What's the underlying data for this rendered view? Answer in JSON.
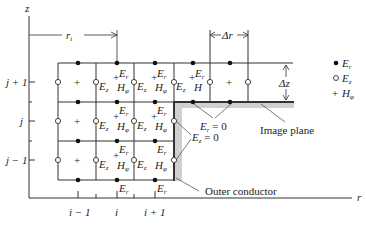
{
  "axes": {
    "z_label": "z",
    "r_label": "r",
    "z_ticks": [
      "j + 1",
      "j",
      "j − 1"
    ],
    "r_ticks": [
      "i − 1",
      "i",
      "i + 1"
    ]
  },
  "dimensions": {
    "ri_label": "r",
    "ri_sub": "i",
    "dr_label": "Δr",
    "dz_label": "Δz"
  },
  "field_labels": {
    "er": "E",
    "er_sub": "r",
    "ez": "E",
    "ez_sub": "z",
    "hphi": "H",
    "hphi_sub": "φ",
    "h_plain": "H"
  },
  "annotations": {
    "er_zero": "E",
    "er_zero_sub": "r",
    "er_zero_eq": " = 0",
    "ez_zero": "E",
    "ez_zero_sub": "z",
    "ez_zero_eq": " = 0",
    "image_plane": "Image plane",
    "outer_conductor": "Outer conductor"
  },
  "legend": {
    "items": [
      {
        "symbol": "filled-dot",
        "label": "E",
        "sub": "r"
      },
      {
        "symbol": "open-circle",
        "label": "E",
        "sub": "z"
      },
      {
        "symbol": "plus",
        "label": "H",
        "sub": "φ"
      }
    ]
  },
  "colors": {
    "line": "#333333",
    "conductor_shade": "#c8c8c8"
  }
}
